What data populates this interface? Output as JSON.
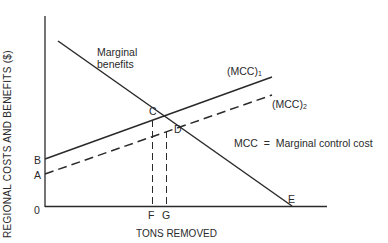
{
  "diagram": {
    "y_axis_label": "REGIONAL COSTS AND BENEFITS ($)",
    "x_axis_label": "TONS REMOVED",
    "origin_label": "0",
    "curves": {
      "marginal_benefits": {
        "label_line1": "Marginal",
        "label_line2": "benefits"
      },
      "mcc1": {
        "label": "(MCC)",
        "subscript": "1",
        "style": "solid"
      },
      "mcc2": {
        "label": "(MCC)",
        "subscript": "2",
        "style": "dashed"
      }
    },
    "points": {
      "A": "A",
      "B": "B",
      "C": "C",
      "D": "D",
      "E": "E",
      "F": "F",
      "G": "G"
    },
    "legend": "MCC  =  Marginal control cost",
    "colors": {
      "ink": "#2a2a2a",
      "background": "#ffffff"
    }
  }
}
